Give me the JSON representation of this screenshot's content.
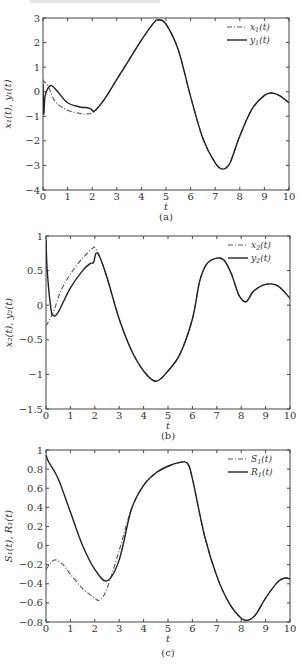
{
  "figure": {
    "panels": [
      {
        "caption": "(a)",
        "xlabel": "t",
        "ylabel": "x₁(t), y₁(t)"
      },
      {
        "caption": "(b)",
        "xlabel": "t",
        "ylabel": "x₂(t), y₂(t)"
      },
      {
        "caption": "(c)",
        "xlabel": "t",
        "ylabel": "S₁(t), R₁(t)"
      }
    ]
  },
  "chart_data": [
    {
      "type": "line",
      "title": "(a)",
      "xlabel": "t",
      "ylabel": "x1(t), y1(t)",
      "xlim": [
        0,
        10
      ],
      "ylim": [
        -4,
        3
      ],
      "xticks": [
        0,
        1,
        2,
        3,
        4,
        5,
        6,
        7,
        8,
        9,
        10
      ],
      "yticks": [
        3,
        2,
        1,
        0,
        -1,
        -2,
        -3,
        -4
      ],
      "grid": false,
      "legend_position": "upper right",
      "box": {
        "x0": 43,
        "x1": 289,
        "y0": 18,
        "y1": 190
      },
      "series": [
        {
          "name": "x1(t)",
          "style": "dashdot",
          "x": [
            0,
            0.05,
            0.2,
            0.5,
            1.0,
            1.5,
            1.8,
            2.1,
            2.5,
            3.0,
            3.5,
            4.0,
            4.5,
            4.7,
            5.0,
            5.5,
            6.0,
            6.5,
            7.0,
            7.3,
            7.6,
            8.0,
            8.5,
            9.0,
            9.3,
            9.6,
            10
          ],
          "y": [
            0.5,
            0.4,
            0.25,
            -0.4,
            -0.75,
            -0.88,
            -0.9,
            -0.8,
            -0.3,
            0.5,
            1.3,
            2.1,
            2.8,
            2.92,
            2.75,
            1.7,
            -0.2,
            -1.9,
            -2.9,
            -3.15,
            -2.9,
            -1.8,
            -0.7,
            -0.15,
            -0.05,
            -0.15,
            -0.45
          ]
        },
        {
          "name": "y1(t)",
          "style": "solid",
          "x": [
            0,
            0.03,
            0.08,
            0.2,
            0.35,
            0.6,
            1.0,
            1.5,
            1.8,
            1.95,
            2.1,
            2.5,
            3.0,
            3.5,
            4.0,
            4.5,
            4.7,
            5.0,
            5.5,
            6.0,
            6.5,
            7.0,
            7.3,
            7.6,
            8.0,
            8.5,
            9.0,
            9.3,
            9.6,
            10
          ],
          "y": [
            0.3,
            -0.9,
            -0.2,
            0.15,
            0.25,
            0.0,
            -0.45,
            -0.62,
            -0.65,
            -0.7,
            -0.78,
            -0.3,
            0.5,
            1.3,
            2.1,
            2.8,
            2.92,
            2.75,
            1.7,
            -0.2,
            -1.9,
            -2.9,
            -3.15,
            -2.9,
            -1.8,
            -0.7,
            -0.15,
            -0.05,
            -0.15,
            -0.45
          ]
        }
      ]
    },
    {
      "type": "line",
      "title": "(b)",
      "xlabel": "t",
      "ylabel": "x2(t), y2(t)",
      "xlim": [
        0,
        10
      ],
      "ylim": [
        -1.5,
        1
      ],
      "xticks": [
        0,
        1,
        2,
        3,
        4,
        5,
        6,
        7,
        8,
        9,
        10
      ],
      "yticks": [
        1,
        0.5,
        0,
        -0.5,
        -1,
        -1.5
      ],
      "grid": false,
      "legend_position": "upper right",
      "box": {
        "x0": 46,
        "x1": 290,
        "y0": 236,
        "y1": 409
      },
      "series": [
        {
          "name": "x2(t)",
          "style": "dashdot",
          "x": [
            0,
            0.3,
            0.6,
            1.0,
            1.5,
            1.9,
            2.0,
            2.2,
            2.5,
            3.0,
            3.5,
            4.0,
            4.5,
            5.0,
            5.5,
            6.0,
            6.3,
            6.6,
            7.0,
            7.3,
            7.6,
            7.9,
            8.2,
            8.5,
            9.0,
            9.5,
            10
          ],
          "y": [
            -0.3,
            -0.1,
            0.2,
            0.45,
            0.68,
            0.82,
            0.83,
            0.7,
            0.4,
            -0.2,
            -0.65,
            -0.95,
            -1.1,
            -0.95,
            -0.7,
            -0.2,
            0.35,
            0.6,
            0.68,
            0.65,
            0.45,
            0.15,
            0.05,
            0.2,
            0.3,
            0.28,
            0.1
          ]
        },
        {
          "name": "y2(t)",
          "style": "solid",
          "x": [
            0,
            0.05,
            0.2,
            0.3,
            0.5,
            1.0,
            1.5,
            1.8,
            1.95,
            2.05,
            2.2,
            2.5,
            3.0,
            3.5,
            4.0,
            4.5,
            5.0,
            5.5,
            6.0,
            6.3,
            6.6,
            7.0,
            7.3,
            7.6,
            7.9,
            8.2,
            8.5,
            9.0,
            9.5,
            10
          ],
          "y": [
            0.95,
            0.5,
            -0.05,
            -0.15,
            -0.1,
            0.25,
            0.5,
            0.6,
            0.62,
            0.75,
            0.7,
            0.4,
            -0.2,
            -0.65,
            -0.95,
            -1.1,
            -0.95,
            -0.7,
            -0.2,
            0.35,
            0.6,
            0.68,
            0.65,
            0.45,
            0.15,
            0.05,
            0.2,
            0.3,
            0.28,
            0.1
          ]
        }
      ]
    },
    {
      "type": "line",
      "title": "(c)",
      "xlabel": "t",
      "ylabel": "S1(t), R1(t)",
      "xlim": [
        0,
        10
      ],
      "ylim": [
        -0.8,
        1
      ],
      "xticks": [
        0,
        1,
        2,
        3,
        4,
        5,
        6,
        7,
        8,
        9,
        10
      ],
      "yticks": [
        1,
        0.8,
        0.6,
        0.4,
        0.2,
        0,
        -0.2,
        -0.4,
        -0.6,
        -0.8
      ],
      "grid": false,
      "legend_position": "upper right",
      "box": {
        "x0": 46,
        "x1": 290,
        "y0": 450,
        "y1": 622
      },
      "series": [
        {
          "name": "S1(t)",
          "style": "dashdot",
          "x": [
            0,
            0.2,
            0.4,
            0.7,
            1.0,
            1.5,
            2.0,
            2.2,
            2.5,
            3.0,
            3.5,
            4.0,
            4.5,
            5.0,
            5.5,
            5.8,
            6.0,
            6.5,
            7.0,
            7.5,
            8.0,
            8.3,
            8.6,
            9.0,
            9.5,
            9.8,
            10
          ],
          "y": [
            -0.25,
            -0.18,
            -0.15,
            -0.2,
            -0.3,
            -0.45,
            -0.55,
            -0.57,
            -0.45,
            -0.05,
            0.38,
            0.63,
            0.76,
            0.83,
            0.87,
            0.86,
            0.7,
            0.1,
            -0.32,
            -0.6,
            -0.76,
            -0.78,
            -0.72,
            -0.55,
            -0.38,
            -0.34,
            -0.35
          ]
        },
        {
          "name": "R1(t)",
          "style": "solid",
          "x": [
            0,
            0.1,
            0.5,
            1.0,
            1.5,
            2.0,
            2.5,
            3.0,
            3.5,
            4.0,
            4.5,
            5.0,
            5.5,
            5.8,
            6.0,
            6.5,
            7.0,
            7.5,
            8.0,
            8.3,
            8.6,
            9.0,
            9.5,
            9.8,
            10
          ],
          "y": [
            0.95,
            0.88,
            0.7,
            0.35,
            0.0,
            -0.25,
            -0.37,
            -0.15,
            0.38,
            0.63,
            0.76,
            0.83,
            0.87,
            0.86,
            0.7,
            0.1,
            -0.32,
            -0.6,
            -0.76,
            -0.78,
            -0.72,
            -0.55,
            -0.38,
            -0.34,
            -0.35
          ]
        }
      ]
    }
  ]
}
